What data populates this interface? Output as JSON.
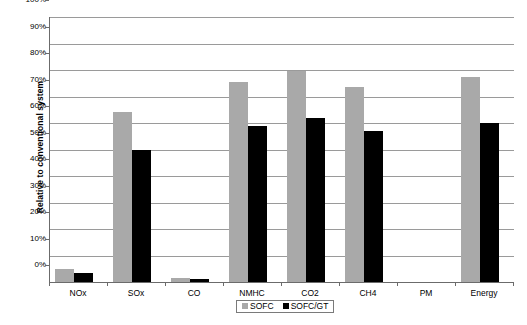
{
  "chart_data": {
    "type": "bar",
    "title": "",
    "subtitle": "",
    "xlabel": "",
    "ylabel": "Relative to conventional system",
    "categories": [
      "NOx",
      "SOx",
      "CO",
      "NMHC",
      "CO2",
      "CH4",
      "PM",
      "Energy"
    ],
    "series": [
      {
        "name": "SOFC",
        "color": "#a9a9a9",
        "values": [
          5,
          64,
          1.5,
          75.5,
          79.5,
          73.5,
          0,
          77.5
        ]
      },
      {
        "name": "SOFC/GT",
        "color": "#000000",
        "values": [
          3.5,
          50,
          1,
          59,
          62,
          57,
          0,
          60
        ]
      }
    ],
    "ylim": [
      0,
      100
    ],
    "ytick_labels": [
      "100%",
      "90%",
      "80%",
      "70%",
      "60%",
      "50%",
      "40%",
      "30%",
      "20%",
      "10%",
      "0%"
    ],
    "ytick_values": [
      100,
      90,
      80,
      70,
      60,
      50,
      40,
      30,
      20,
      10,
      0
    ],
    "grid": true,
    "legend_position": "bottom-center",
    "value_suffix": "%"
  }
}
